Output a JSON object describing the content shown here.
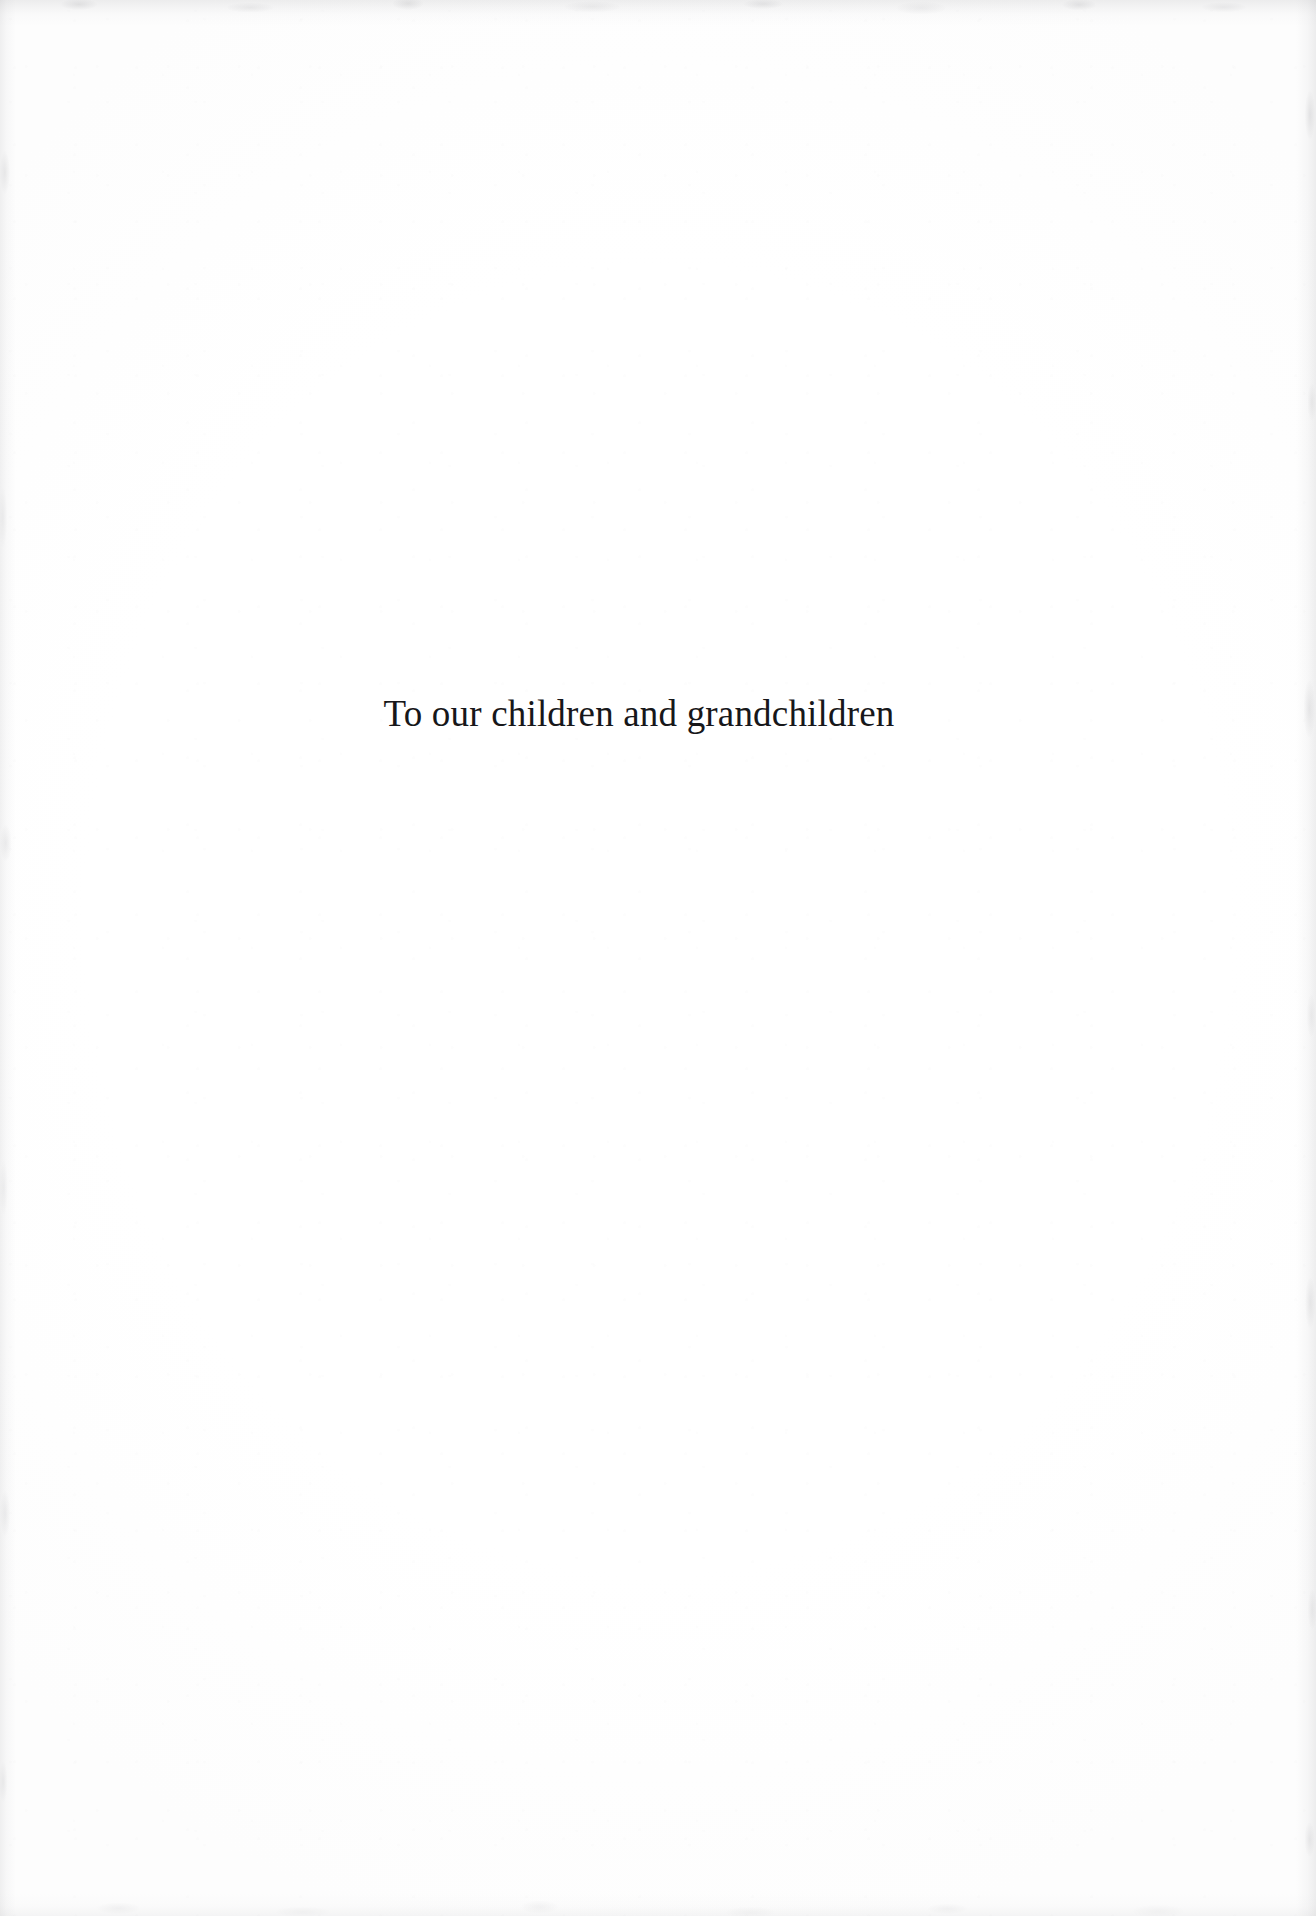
{
  "page": {
    "kind": "book-dedication-page",
    "width": 1316,
    "height": 1916,
    "background_color": "#ffffff",
    "paper_edge_tone_color": "#9a9a9e"
  },
  "dedication": {
    "text": "To our children and grandchildren",
    "text_color": "#17171a",
    "alignment": "center",
    "font_style": "serif"
  }
}
